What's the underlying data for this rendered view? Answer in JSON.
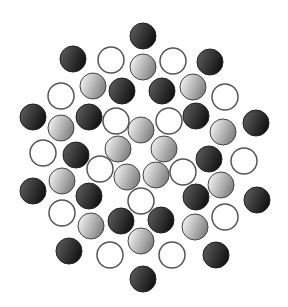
{
  "canvas": {
    "width": 288,
    "height": 307,
    "background": "#ffffff"
  },
  "style": {
    "radius": 13,
    "colors": {
      "black": {
        "from": "#5a5a5a",
        "to": "#0e0e0e",
        "stroke": "#222222"
      },
      "gray": {
        "from": "#f2f2f2",
        "to": "#7a7a7a",
        "stroke": "#444444"
      },
      "white": {
        "from": "#ffffff",
        "to": "#ffffff",
        "stroke": "#555555"
      }
    }
  },
  "circles": [
    {
      "type": "black",
      "x": 143,
      "y": 36
    },
    {
      "type": "black",
      "x": 73,
      "y": 59
    },
    {
      "type": "white",
      "x": 111,
      "y": 60
    },
    {
      "type": "gray",
      "x": 143,
      "y": 67
    },
    {
      "type": "white",
      "x": 173,
      "y": 61
    },
    {
      "type": "black",
      "x": 210,
      "y": 62
    },
    {
      "type": "white",
      "x": 61,
      "y": 96
    },
    {
      "type": "gray",
      "x": 93,
      "y": 86
    },
    {
      "type": "black",
      "x": 122,
      "y": 91
    },
    {
      "type": "black",
      "x": 162,
      "y": 91
    },
    {
      "type": "gray",
      "x": 193,
      "y": 87
    },
    {
      "type": "white",
      "x": 225,
      "y": 97
    },
    {
      "type": "black",
      "x": 33,
      "y": 117
    },
    {
      "type": "gray",
      "x": 61,
      "y": 128
    },
    {
      "type": "black",
      "x": 89,
      "y": 117
    },
    {
      "type": "white",
      "x": 116,
      "y": 121
    },
    {
      "type": "gray",
      "x": 141,
      "y": 130
    },
    {
      "type": "white",
      "x": 169,
      "y": 121
    },
    {
      "type": "black",
      "x": 196,
      "y": 116
    },
    {
      "type": "gray",
      "x": 223,
      "y": 132
    },
    {
      "type": "black",
      "x": 256,
      "y": 123
    },
    {
      "type": "white",
      "x": 43,
      "y": 153
    },
    {
      "type": "black",
      "x": 76,
      "y": 155
    },
    {
      "type": "gray",
      "x": 118,
      "y": 149
    },
    {
      "type": "gray",
      "x": 164,
      "y": 149
    },
    {
      "type": "black",
      "x": 209,
      "y": 159
    },
    {
      "type": "white",
      "x": 244,
      "y": 161
    },
    {
      "type": "white",
      "x": 100,
      "y": 169
    },
    {
      "type": "gray",
      "x": 62,
      "y": 181
    },
    {
      "type": "gray",
      "x": 127,
      "y": 177
    },
    {
      "type": "gray",
      "x": 156,
      "y": 175
    },
    {
      "type": "white",
      "x": 183,
      "y": 172
    },
    {
      "type": "gray",
      "x": 221,
      "y": 185
    },
    {
      "type": "black",
      "x": 33,
      "y": 191
    },
    {
      "type": "black",
      "x": 89,
      "y": 196
    },
    {
      "type": "white",
      "x": 141,
      "y": 201
    },
    {
      "type": "black",
      "x": 196,
      "y": 197
    },
    {
      "type": "black",
      "x": 257,
      "y": 200
    },
    {
      "type": "white",
      "x": 62,
      "y": 213
    },
    {
      "type": "gray",
      "x": 91,
      "y": 226
    },
    {
      "type": "black",
      "x": 121,
      "y": 221
    },
    {
      "type": "black",
      "x": 161,
      "y": 220
    },
    {
      "type": "gray",
      "x": 195,
      "y": 227
    },
    {
      "type": "white",
      "x": 225,
      "y": 217
    },
    {
      "type": "gray",
      "x": 141,
      "y": 241
    },
    {
      "type": "black",
      "x": 69,
      "y": 251
    },
    {
      "type": "white",
      "x": 110,
      "y": 255
    },
    {
      "type": "white",
      "x": 172,
      "y": 255
    },
    {
      "type": "black",
      "x": 216,
      "y": 255
    },
    {
      "type": "black",
      "x": 143,
      "y": 279
    }
  ]
}
